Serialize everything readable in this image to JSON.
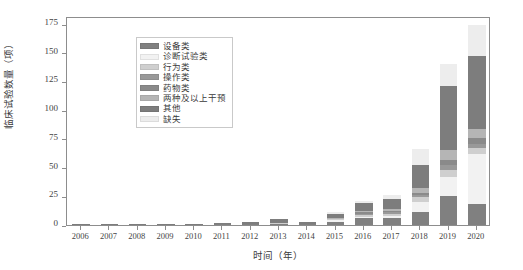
{
  "chart_data": {
    "type": "bar",
    "subtype": "stacked-bar",
    "title": "",
    "xlabel": "时间（年）",
    "ylabel": "临床试验数量（项）",
    "categories": [
      "2006",
      "2007",
      "2008",
      "2009",
      "2010",
      "2011",
      "2012",
      "2013",
      "2014",
      "2015",
      "2016",
      "2017",
      "2018",
      "2019",
      "2020"
    ],
    "ylim": [
      0,
      182
    ],
    "yticks": [
      0,
      25,
      50,
      75,
      100,
      125,
      150,
      175
    ],
    "ytick_labels": [
      "0",
      "25",
      "50",
      "75",
      "100",
      "125",
      "150",
      "175"
    ],
    "grid": false,
    "legend_position": "upper left",
    "series": [
      {
        "name": "设备类",
        "color": "#808080",
        "values": [
          0,
          0,
          0,
          0,
          0,
          1,
          1,
          1,
          1,
          3,
          6,
          6,
          11,
          25,
          18
        ]
      },
      {
        "name": "诊断试验类",
        "color": "#f2f2f2",
        "values": [
          0,
          0,
          0,
          0,
          0,
          0,
          0,
          0,
          0,
          1,
          1,
          2,
          9,
          17,
          44
        ]
      },
      {
        "name": "行为类",
        "color": "#cfcfcf",
        "values": [
          0,
          0,
          0,
          0,
          0,
          0,
          0,
          1,
          0,
          1,
          2,
          2,
          4,
          6,
          5
        ]
      },
      {
        "name": "操作类",
        "color": "#999999",
        "values": [
          0,
          0,
          0,
          0,
          0,
          0,
          0,
          0,
          0,
          0,
          1,
          1,
          2,
          4,
          4
        ]
      },
      {
        "name": "药物类",
        "color": "#8a8a8a",
        "values": [
          0,
          0,
          0,
          0,
          0,
          0,
          0,
          0,
          0,
          0,
          1,
          1,
          2,
          5,
          5
        ]
      },
      {
        "name": "两种及以上干预",
        "color": "#b5b5b5",
        "values": [
          0,
          0,
          0,
          0,
          0,
          0,
          0,
          0,
          0,
          1,
          1,
          2,
          4,
          8,
          8
        ]
      },
      {
        "name": "其他",
        "color": "#7d7d7d",
        "values": [
          1,
          1,
          1,
          1,
          1,
          1,
          2,
          3,
          2,
          4,
          7,
          9,
          20,
          56,
          63
        ]
      },
      {
        "name": "缺失",
        "color": "#ededed",
        "values": [
          0,
          0,
          0,
          0,
          0,
          0,
          0,
          0,
          0,
          1,
          2,
          3,
          14,
          19,
          27
        ]
      }
    ]
  },
  "legend": {
    "items": [
      {
        "label": "设备类",
        "color": "#808080"
      },
      {
        "label": "诊断试验类",
        "color": "#f2f2f2"
      },
      {
        "label": "行为类",
        "color": "#cfcfcf"
      },
      {
        "label": "操作类",
        "color": "#999999"
      },
      {
        "label": "药物类",
        "color": "#8a8a8a"
      },
      {
        "label": "两种及以上干预",
        "color": "#b5b5b5"
      },
      {
        "label": "其他",
        "color": "#7d7d7d"
      },
      {
        "label": "缺失",
        "color": "#ededed"
      }
    ]
  },
  "axes": {
    "x_title": "时间（年）",
    "y_title": "临床试验数量（项）"
  }
}
